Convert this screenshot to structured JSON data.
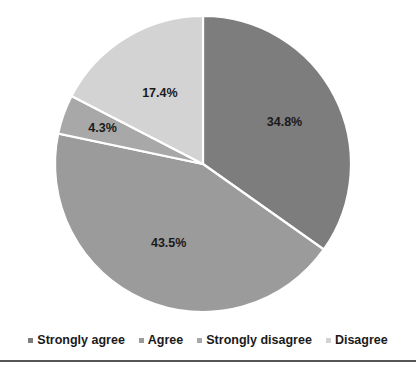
{
  "chart_data": {
    "type": "pie",
    "title": "",
    "categories": [
      "Strongly agree",
      "Agree",
      "Strongly disagree",
      "Disagree"
    ],
    "values": [
      34.8,
      43.5,
      4.3,
      17.4
    ],
    "data_labels": [
      "34.8%",
      "43.5%",
      "4.3%",
      "17.4%"
    ],
    "colors": [
      "#7d7d7d",
      "#9b9b9b",
      "#a8a8a8",
      "#d3d3d3"
    ],
    "legend_position": "bottom",
    "grid": false,
    "start_angle_deg": 0,
    "direction": "clockwise",
    "slice_border_color": "#ffffff",
    "value_suffix": "%"
  },
  "legend": {
    "items": [
      {
        "label": "Strongly agree",
        "color": "#7d7d7d"
      },
      {
        "label": "Agree",
        "color": "#9b9b9b"
      },
      {
        "label": "Strongly disagree",
        "color": "#a8a8a8"
      },
      {
        "label": "Disagree",
        "color": "#d3d3d3"
      }
    ]
  },
  "labels": {
    "slice_0": "34.8%",
    "slice_1": "43.5%",
    "slice_2": "4.3%",
    "slice_3": "17.4%"
  }
}
